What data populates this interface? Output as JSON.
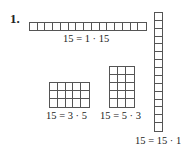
{
  "problem": {
    "number": "1."
  },
  "arrays": [
    {
      "id": "1x15",
      "rows": 1,
      "cols": 15,
      "label": "15 = 1 · 15"
    },
    {
      "id": "3x5",
      "rows": 3,
      "cols": 5,
      "label": "15 = 3 · 5"
    },
    {
      "id": "5x3",
      "rows": 5,
      "cols": 3,
      "label": "15 = 5 · 3"
    },
    {
      "id": "15x1",
      "rows": 15,
      "cols": 1,
      "label": "15 = 15 · 1"
    }
  ]
}
